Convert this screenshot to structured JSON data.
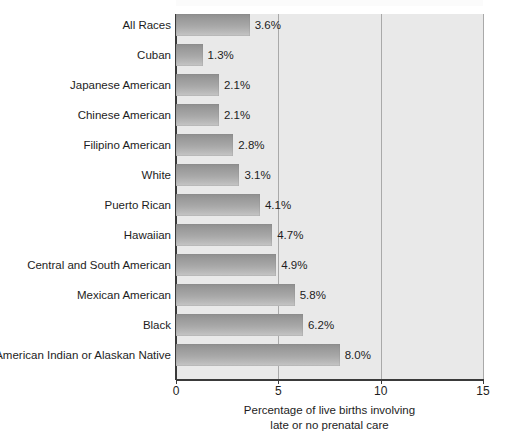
{
  "artifact": {
    "ghost_text": " "
  },
  "chart_data": {
    "type": "bar",
    "orientation": "horizontal",
    "title": "",
    "subtitle": "",
    "xlabel_line1": "Percentage of live births involving",
    "xlabel_line2": "late or no prenatal care",
    "ylabel": "",
    "xlim": [
      0,
      15
    ],
    "xticks": [
      0,
      5,
      10,
      15
    ],
    "xtick_labels": [
      "0",
      "5",
      "10",
      "15"
    ],
    "grid": true,
    "grid_axis": "x",
    "legend": false,
    "value_suffix": "%",
    "categories": [
      "All Races",
      "Cuban",
      "Japanese American",
      "Chinese American",
      "Filipino American",
      "White",
      "Puerto Rican",
      "Hawaiian",
      "Central and South American",
      "Mexican American",
      "Black",
      "American Indian or Alaskan Native"
    ],
    "values": [
      3.6,
      1.3,
      2.1,
      2.1,
      2.8,
      3.1,
      4.1,
      4.7,
      4.9,
      5.8,
      6.2,
      8.0
    ],
    "value_labels": [
      "3.6%",
      "1.3%",
      "2.1%",
      "2.1%",
      "2.8%",
      "3.1%",
      "4.1%",
      "4.7%",
      "4.9%",
      "5.8%",
      "6.2%",
      "8.0%"
    ],
    "colors": {
      "plot_background": "#e9e9e9",
      "bar_gradient_dark": "#8e8e8e",
      "bar_gradient_light": "#c6c6c6",
      "gridline": "#a9a9a9",
      "axis": "#3a3a3a",
      "text": "#1d1d1d",
      "page_background": "#ffffff"
    }
  }
}
